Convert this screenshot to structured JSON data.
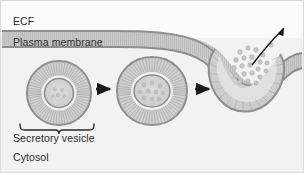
{
  "figure": {
    "background_color": "#f2f2f0",
    "frame_color": "#d9d9d9"
  },
  "labels": {
    "ecf": "ECF",
    "plasma_membrane": "Plasma membrane",
    "secretory_vesicle": "Secretory vesicle",
    "cytosol": "Cytosol"
  },
  "colors": {
    "membrane_fill": "#c9c9c6",
    "membrane_outline": "#8e8e8c",
    "vesicle_fill": "#cfcfcc",
    "vesicle_outline": "#8e8e8c",
    "vesicle_core_fill": "#d6d6d3",
    "cargo_granule": "#c2c2bf",
    "arrow_black": "#1a1a1a",
    "ecf_background": "#fbfbfa",
    "cytosol_background": "#f2f2f0",
    "text": "#2b2b2b"
  },
  "regions": [
    {
      "name": "ECF",
      "position": "above membrane"
    },
    {
      "name": "Cytosol",
      "position": "below membrane"
    }
  ],
  "stages": [
    {
      "index": 1,
      "name": "free-secretory-vesicle",
      "description": "Spherical secretory vesicle free in the cytosol with lipid bilayer and cargo core"
    },
    {
      "index": 2,
      "name": "docked-vesicle",
      "description": "Vesicle docked against the inner face of the plasma membrane, flattened at contact"
    },
    {
      "index": 3,
      "name": "fused-vesicle",
      "description": "Vesicle membrane fused with plasma membrane forming a pore; cargo released into ECF"
    }
  ],
  "arrows": [
    {
      "name": "stage-arrow-1",
      "type": "straight",
      "direction": "right"
    },
    {
      "name": "stage-arrow-2",
      "type": "straight",
      "direction": "right"
    },
    {
      "name": "secretion-arrow",
      "type": "curved",
      "direction": "up-right"
    }
  ],
  "secreted_granule_count": 22
}
